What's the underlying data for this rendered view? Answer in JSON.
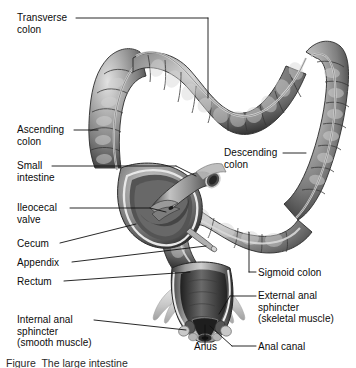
{
  "figure": {
    "caption": "Figure  The large intestine",
    "palette": {
      "background": "#ffffff",
      "ink": "#0b0b0b",
      "leader": "#111111",
      "tissue_mid": "#8a8a8a",
      "tissue_dark": "#3d3d3d",
      "tissue_shadow": "#262626",
      "tissue_light": "#c8c8c8",
      "tissue_highlight": "#e6e6e6",
      "lumen": "#2b2b2b",
      "muscle_pale": "#d8d8d8"
    }
  },
  "labels": [
    {
      "id": "transverse-colon",
      "text": "Transverse\ncolon",
      "x": 17,
      "y": 12,
      "align": "left"
    },
    {
      "id": "ascending-colon",
      "text": "Ascending\ncolon",
      "x": 17,
      "y": 124,
      "align": "left"
    },
    {
      "id": "small-intestine",
      "text": "Small\nintestine",
      "x": 17,
      "y": 160,
      "align": "left"
    },
    {
      "id": "ileocecal-valve",
      "text": "Ileocecal\nvalve",
      "x": 17,
      "y": 202,
      "align": "left"
    },
    {
      "id": "cecum",
      "text": "Cecum",
      "x": 17,
      "y": 238,
      "align": "left"
    },
    {
      "id": "appendix",
      "text": "Appendix",
      "x": 17,
      "y": 257,
      "align": "left"
    },
    {
      "id": "rectum",
      "text": "Rectum",
      "x": 17,
      "y": 276,
      "align": "left"
    },
    {
      "id": "internal-anal-sphincter",
      "text": "Internal anal\nsphincter\n(smooth muscle)",
      "x": 17,
      "y": 314,
      "align": "left"
    },
    {
      "id": "descending-colon",
      "text": "Descending\ncolon",
      "x": 224,
      "y": 147,
      "align": "left"
    },
    {
      "id": "sigmoid-colon",
      "text": "Sigmoid colon",
      "x": 258,
      "y": 267,
      "align": "left"
    },
    {
      "id": "external-anal-sphincter",
      "text": "External anal\nsphincter\n(skeletal muscle)",
      "x": 258,
      "y": 290,
      "align": "left"
    },
    {
      "id": "anus",
      "text": "Anus",
      "x": 194,
      "y": 341,
      "align": "left"
    },
    {
      "id": "anal-canal",
      "text": "Anal canal",
      "x": 258,
      "y": 341,
      "align": "left"
    }
  ],
  "structures": [
    {
      "id": "transverse-colon",
      "name": "Transverse colon"
    },
    {
      "id": "ascending-colon",
      "name": "Ascending colon"
    },
    {
      "id": "descending-colon",
      "name": "Descending colon"
    },
    {
      "id": "sigmoid-colon",
      "name": "Sigmoid colon"
    },
    {
      "id": "cecum",
      "name": "Cecum"
    },
    {
      "id": "appendix",
      "name": "Appendix"
    },
    {
      "id": "ileum",
      "name": "Small intestine (ileum)"
    },
    {
      "id": "ileocecal-valve",
      "name": "Ileocecal valve"
    },
    {
      "id": "rectum",
      "name": "Rectum"
    },
    {
      "id": "anal-canal",
      "name": "Anal canal"
    },
    {
      "id": "anus",
      "name": "Anus"
    },
    {
      "id": "internal-anal-sphincter",
      "name": "Internal anal sphincter"
    },
    {
      "id": "external-anal-sphincter",
      "name": "External anal sphincter"
    }
  ]
}
